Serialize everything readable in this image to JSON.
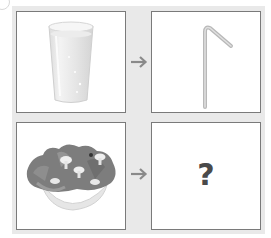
{
  "puzzle": {
    "rows": [
      {
        "left": {
          "item": "glass-of-water",
          "kind": "image"
        },
        "connector": {
          "icon": "arrow-right-icon",
          "glyph": "→"
        },
        "right": {
          "item": "drinking-straw",
          "kind": "image"
        }
      },
      {
        "left": {
          "item": "bowl-of-salad",
          "kind": "image"
        },
        "connector": {
          "icon": "arrow-right-icon",
          "glyph": "→"
        },
        "right": {
          "item": "unknown",
          "kind": "text",
          "text": "?"
        }
      }
    ]
  },
  "colors": {
    "panel_background": "#e9e9e9",
    "box_background": "#ffffff",
    "box_border": "#7a7a7a",
    "arrow": "#8a8a8a",
    "question_mark": "#4a4a4a"
  }
}
